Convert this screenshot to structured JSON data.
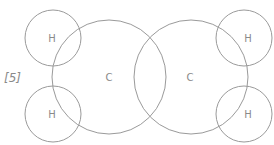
{
  "question_mark": "[5]",
  "atoms": {
    "carbon_left": {
      "label": "C",
      "cx": 109,
      "cy": 77,
      "r": 57
    },
    "carbon_right": {
      "label": "C",
      "cx": 191,
      "cy": 77,
      "r": 57
    },
    "hydrogen_top_left": {
      "label": "H",
      "cx": 53,
      "cy": 38,
      "r": 28
    },
    "hydrogen_bottom_left": {
      "label": "H",
      "cx": 53,
      "cy": 114,
      "r": 28
    },
    "hydrogen_top_right": {
      "label": "H",
      "cx": 244,
      "cy": 38,
      "r": 28
    },
    "hydrogen_bottom_right": {
      "label": "H",
      "cx": 244,
      "cy": 114,
      "r": 28
    }
  },
  "colors": {
    "stroke": "#9a9a9a",
    "text": "#8a8a8a"
  }
}
